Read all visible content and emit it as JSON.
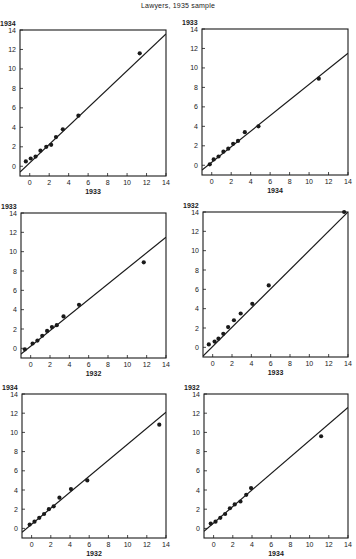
{
  "title": "Lawyers, 1935 sample",
  "chart_data": [
    {
      "type": "scatter",
      "title": "",
      "xlabel": "1933",
      "ylabel": "1934",
      "xlim": [
        -1,
        14
      ],
      "ylim": [
        -1,
        14
      ],
      "xticks": [
        0,
        2,
        4,
        6,
        8,
        10,
        12,
        14
      ],
      "yticks": [
        0,
        2,
        4,
        6,
        8,
        10,
        12,
        14
      ],
      "grid": false,
      "points": [
        [
          -0.4,
          0.5
        ],
        [
          0.1,
          0.8
        ],
        [
          0.6,
          1.0
        ],
        [
          1.1,
          1.6
        ],
        [
          1.7,
          2.0
        ],
        [
          2.2,
          2.2
        ],
        [
          2.7,
          3.0
        ],
        [
          3.4,
          3.8
        ],
        [
          5.0,
          5.2
        ],
        [
          11.3,
          11.6
        ]
      ],
      "fit_line": [
        [
          -1,
          -0.6
        ],
        [
          14,
          13.6
        ]
      ],
      "frame": {
        "left": 20,
        "top": 30,
        "size": 146
      }
    },
    {
      "type": "scatter",
      "title": "",
      "xlabel": "1934",
      "ylabel": "1933",
      "xlim": [
        -1,
        14
      ],
      "ylim": [
        -1,
        14
      ],
      "xticks": [
        0,
        2,
        4,
        6,
        8,
        10,
        12,
        14
      ],
      "yticks": [
        0,
        2,
        4,
        6,
        8,
        10,
        12,
        14
      ],
      "grid": false,
      "points": [
        [
          -0.2,
          0.1
        ],
        [
          0.2,
          0.6
        ],
        [
          0.7,
          0.9
        ],
        [
          1.2,
          1.4
        ],
        [
          1.7,
          1.7
        ],
        [
          2.2,
          2.2
        ],
        [
          2.7,
          2.5
        ],
        [
          3.4,
          3.4
        ],
        [
          4.8,
          4.0
        ],
        [
          11.0,
          8.9
        ]
      ],
      "fit_line": [
        [
          -1,
          -0.5
        ],
        [
          14,
          11.5
        ]
      ],
      "frame": {
        "left": 202,
        "top": 29,
        "size": 146
      }
    },
    {
      "type": "scatter",
      "title": "",
      "xlabel": "1932",
      "ylabel": "1933",
      "xlim": [
        -1,
        14
      ],
      "ylim": [
        -1,
        14
      ],
      "xticks": [
        0,
        2,
        4,
        6,
        8,
        10,
        12,
        14
      ],
      "yticks": [
        0,
        2,
        4,
        6,
        8,
        10,
        12,
        14
      ],
      "grid": false,
      "points": [
        [
          -0.6,
          -0.1
        ],
        [
          0.2,
          0.5
        ],
        [
          0.7,
          0.8
        ],
        [
          1.2,
          1.3
        ],
        [
          1.7,
          1.8
        ],
        [
          2.2,
          2.2
        ],
        [
          2.7,
          2.4
        ],
        [
          3.4,
          3.3
        ],
        [
          5.0,
          4.5
        ],
        [
          11.7,
          8.9
        ]
      ],
      "fit_line": [
        [
          -1,
          -0.6
        ],
        [
          14,
          11.5
        ]
      ],
      "frame": {
        "left": 21,
        "top": 213,
        "size": 145
      }
    },
    {
      "type": "scatter",
      "title": "",
      "xlabel": "1933",
      "ylabel": "1932",
      "xlim": [
        -1,
        14
      ],
      "ylim": [
        -1,
        14
      ],
      "xticks": [
        0,
        2,
        4,
        6,
        8,
        10,
        12,
        14
      ],
      "yticks": [
        0,
        2,
        4,
        6,
        8,
        10,
        12,
        14
      ],
      "grid": false,
      "points": [
        [
          -0.4,
          0.3
        ],
        [
          0.2,
          0.6
        ],
        [
          0.6,
          0.9
        ],
        [
          1.1,
          1.4
        ],
        [
          1.6,
          2.1
        ],
        [
          2.2,
          2.8
        ],
        [
          2.9,
          3.5
        ],
        [
          4.1,
          4.5
        ],
        [
          5.8,
          6.4
        ],
        [
          13.6,
          14.0
        ]
      ],
      "fit_line": [
        [
          -1,
          -0.9
        ],
        [
          14,
          14.0
        ]
      ],
      "frame": {
        "left": 203,
        "top": 212,
        "size": 145
      }
    },
    {
      "type": "scatter",
      "title": "",
      "xlabel": "1932",
      "ylabel": "1934",
      "xlim": [
        -1,
        14
      ],
      "ylim": [
        -1,
        14
      ],
      "xticks": [
        0,
        2,
        4,
        6,
        8,
        10,
        12,
        14
      ],
      "yticks": [
        0,
        2,
        4,
        6,
        8,
        10,
        12,
        14
      ],
      "grid": false,
      "points": [
        [
          -0.2,
          0.4
        ],
        [
          0.3,
          0.7
        ],
        [
          0.8,
          1.1
        ],
        [
          1.3,
          1.5
        ],
        [
          1.8,
          2.0
        ],
        [
          2.3,
          2.3
        ],
        [
          2.9,
          3.2
        ],
        [
          4.1,
          4.1
        ],
        [
          5.8,
          5.0
        ],
        [
          13.3,
          10.8
        ]
      ],
      "fit_line": [
        [
          -1,
          -0.4
        ],
        [
          14,
          12.1
        ]
      ],
      "frame": {
        "left": 22,
        "top": 394,
        "size": 144
      }
    },
    {
      "type": "scatter",
      "title": "",
      "xlabel": "1934",
      "ylabel": "1932",
      "xlim": [
        -1,
        14
      ],
      "ylim": [
        -1,
        14
      ],
      "xticks": [
        0,
        2,
        4,
        6,
        8,
        10,
        12,
        14
      ],
      "yticks": [
        0,
        2,
        4,
        6,
        8,
        10,
        12,
        14
      ],
      "grid": false,
      "points": [
        [
          -0.3,
          0.5
        ],
        [
          0.2,
          0.7
        ],
        [
          0.7,
          1.1
        ],
        [
          1.2,
          1.5
        ],
        [
          1.7,
          2.1
        ],
        [
          2.2,
          2.5
        ],
        [
          2.8,
          2.8
        ],
        [
          3.4,
          3.5
        ],
        [
          3.9,
          4.2
        ],
        [
          11.2,
          9.6
        ]
      ],
      "fit_line": [
        [
          -1,
          -0.3
        ],
        [
          14,
          12.6
        ]
      ],
      "frame": {
        "left": 204,
        "top": 394,
        "size": 144
      }
    }
  ]
}
